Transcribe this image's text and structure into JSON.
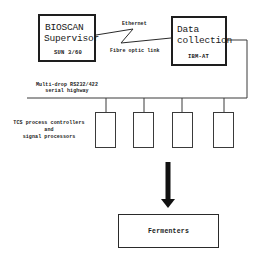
{
  "diagram": {
    "nodes": {
      "bioscan": {
        "title_line1": "BIOSCAN",
        "title_line2": "Supervisor",
        "subtitle": "SUN 3/60"
      },
      "data_collection": {
        "title_line1": "Data",
        "title_line2": "collection",
        "subtitle": "IBM-AT"
      },
      "processors": {
        "label_line1": "TCS process controllers",
        "label_line2": "and",
        "label_line3": "signal processors",
        "count": 4
      },
      "fermenters": {
        "label": "Fermenters"
      }
    },
    "links": {
      "network": {
        "label_top": "Ethernet",
        "label_bottom": "Fibre optic link"
      },
      "highway": {
        "label_line1": "Multi-drop RS232/422",
        "label_line2": "serial highway"
      }
    },
    "colors": {
      "line": "#2a2a2a",
      "background": "#ffffff",
      "arrow": "#111111"
    }
  }
}
